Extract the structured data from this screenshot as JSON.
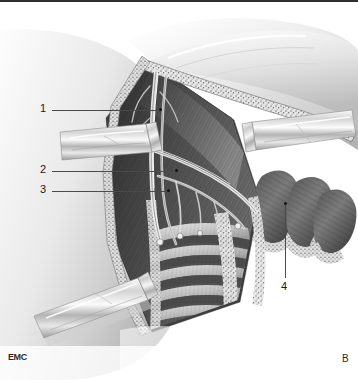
{
  "figure": {
    "type": "anatomical-surgical-illustration",
    "style": "grayscale pen-and-wash medical drawing",
    "panel_letter": "B",
    "watermark": "EMC",
    "background_color": "#ffffff",
    "ink_color": "#1a1a1a",
    "leader_color": "#4a4a4a"
  },
  "labels": [
    {
      "id": "1",
      "text": "1",
      "text_x": 40,
      "text_y": 103,
      "line_x1": 52,
      "line_x2": 162,
      "line_y": 110,
      "dot_x": 161,
      "dot_y": 109
    },
    {
      "id": "2",
      "text": "2",
      "text_x": 40,
      "text_y": 164,
      "line_x1": 52,
      "line_x2": 178,
      "line_y": 171,
      "dot_x": 177,
      "dot_y": 170
    },
    {
      "id": "3",
      "text": "3",
      "text_x": 40,
      "text_y": 184,
      "line_x1": 52,
      "line_x2": 170,
      "line_y": 191,
      "dot_x": 169,
      "dot_y": 190
    },
    {
      "id": "4",
      "text": "4",
      "text_x": 281,
      "text_y": 283,
      "line_x": 285,
      "line_y1": 204,
      "line_y2": 278,
      "dot_x": 284,
      "dot_y": 203
    }
  ],
  "regions": {
    "skin_flap_upper": "retracted skin and subcutaneous fat flap, upper field",
    "skin_flap_left": "arm / upper limb skin surface, left of field",
    "retractor_left": "metal retractor blade, mid-left",
    "retractor_right": "metal retractor blade, upper-right",
    "retractor_lower": "metal retractor blade, lower-left",
    "neurovascular_bundle": "axillary vessels and brachial plexus branches in centre of field",
    "rib_cage": "exposed ribs with intercostal muscles, lower centre",
    "muscle_stumps": "divided muscle bellies retracted laterally, right of field",
    "serratus": "serratus anterior digitations along chest wall"
  }
}
